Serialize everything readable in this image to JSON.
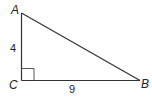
{
  "figure": {
    "type": "right-triangle",
    "vertices": {
      "A": {
        "label": "A"
      },
      "B": {
        "label": "B"
      },
      "C": {
        "label": "C"
      }
    },
    "sides": {
      "AC": {
        "length_label": "4"
      },
      "CB": {
        "length_label": "9"
      }
    },
    "right_angle_at": "C",
    "colors": {
      "stroke": "#333333",
      "text": "#222222",
      "background": "#ffffff"
    }
  }
}
